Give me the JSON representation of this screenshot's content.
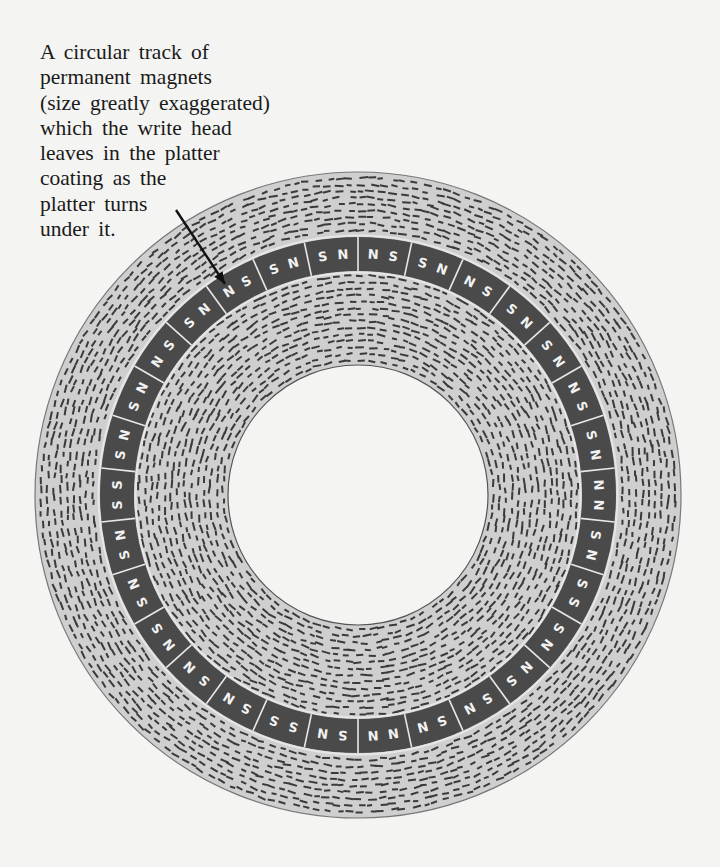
{
  "caption": {
    "lines": [
      "A circular track of",
      "permanent magnets",
      "(size greatly exaggerated)",
      "which the write head",
      "leaves in the platter",
      "coating as the",
      "platter turns",
      "under it."
    ]
  },
  "diagram": {
    "center": [
      358,
      495
    ],
    "outer_radius": 323,
    "track_outer_radius": 258,
    "track_inner_radius": 224,
    "hole_radius": 130,
    "colors": {
      "background": "#f4f4f2",
      "coating": "#cfcfcf",
      "coating_dash": "#3a3a3a",
      "track": "#4a4a4a",
      "track_divider": "#e8e8e8",
      "pole_label": "#f2f2f2",
      "hole": "#f4f4f2",
      "arrow": "#111111"
    },
    "magnet_boundaries_clockwise_from_top": [
      "NN",
      "SS",
      "NN",
      "SS",
      "NS",
      "NN",
      "SS",
      "NN",
      "NS",
      "NS",
      "SS",
      "NN",
      "SS",
      "NS",
      "NN",
      "NS",
      "NS",
      "SS",
      "NS",
      "NN",
      "SS",
      "NS",
      "NS",
      "SS",
      "NS",
      "NN",
      "SS",
      "NN",
      "SS",
      "NS"
    ],
    "arrow": {
      "from": [
        176,
        210
      ],
      "to": [
        225,
        284
      ]
    }
  }
}
